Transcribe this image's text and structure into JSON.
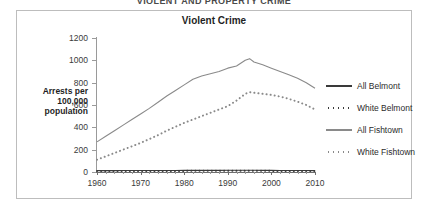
{
  "page": {
    "top_caption": "VIOLENT AND PROPERTY CRIME"
  },
  "figure": {
    "title": "Violent Crime",
    "y_axis_title": "Arrests per 100,000 population"
  },
  "legend": {
    "position": "right",
    "items": [
      {
        "label": "All Belmont",
        "style": "solid",
        "color": "#3a3a3a"
      },
      {
        "label": "White Belmont",
        "style": "dotted",
        "color": "#3a3a3a"
      },
      {
        "label": "All Fishtown",
        "style": "solid",
        "color": "#8a8a8a"
      },
      {
        "label": "White Fishtown",
        "style": "dotted",
        "color": "#8a8a8a"
      }
    ]
  },
  "chart_data": {
    "type": "line",
    "title": "Violent Crime",
    "xlabel": "",
    "ylabel": "Arrests per 100,000 population",
    "xlim": [
      1960,
      2010
    ],
    "ylim": [
      0,
      1200
    ],
    "ytick_labels": [
      "0",
      "200",
      "400",
      "600",
      "800",
      "1000",
      "1200"
    ],
    "yticks": [
      0,
      200,
      400,
      600,
      800,
      1000,
      1200
    ],
    "xtick_labels": [
      "1960",
      "1970",
      "1980",
      "1990",
      "2000",
      "2010"
    ],
    "xticks": [
      1960,
      1970,
      1980,
      1990,
      2000,
      2010
    ],
    "x_minor_tick_interval": 2,
    "grid": false,
    "legend_position": "right",
    "x": [
      1960,
      1962,
      1964,
      1966,
      1968,
      1970,
      1972,
      1974,
      1976,
      1978,
      1980,
      1982,
      1984,
      1986,
      1988,
      1990,
      1992,
      1994,
      1995,
      1996,
      1998,
      2000,
      2002,
      2004,
      2006,
      2008,
      2010
    ],
    "series": [
      {
        "name": "All Belmont",
        "style": "solid",
        "color": "#3a3a3a",
        "values": [
          12,
          12,
          12,
          13,
          13,
          13,
          13,
          14,
          14,
          14,
          15,
          15,
          15,
          15,
          15,
          16,
          16,
          16,
          16,
          16,
          15,
          15,
          14,
          14,
          13,
          13,
          12
        ]
      },
      {
        "name": "White Belmont",
        "style": "dotted",
        "color": "#3a3a3a",
        "values": [
          8,
          8,
          8,
          9,
          9,
          9,
          9,
          10,
          10,
          10,
          10,
          11,
          11,
          11,
          11,
          11,
          11,
          11,
          11,
          11,
          11,
          10,
          10,
          10,
          9,
          9,
          9
        ]
      },
      {
        "name": "All Fishtown",
        "style": "solid",
        "color": "#8a8a8a",
        "values": [
          270,
          320,
          370,
          420,
          470,
          520,
          570,
          625,
          680,
          730,
          780,
          830,
          860,
          880,
          900,
          930,
          950,
          1000,
          1015,
          985,
          960,
          930,
          900,
          870,
          840,
          800,
          750
        ]
      },
      {
        "name": "White Fishtown",
        "style": "dotted",
        "color": "#8a8a8a",
        "values": [
          110,
          140,
          170,
          200,
          230,
          260,
          295,
          330,
          370,
          405,
          440,
          470,
          500,
          530,
          560,
          590,
          640,
          700,
          715,
          710,
          700,
          690,
          675,
          655,
          630,
          600,
          560
        ]
      }
    ]
  }
}
